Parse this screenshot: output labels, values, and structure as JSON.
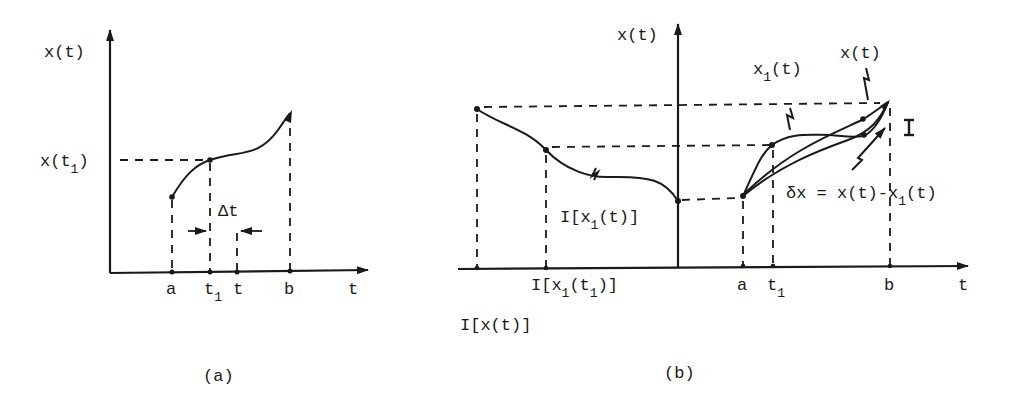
{
  "figure_a": {
    "caption": "(a)",
    "y_axis_label": "x(t)",
    "x_axis_label": "t",
    "y_marker_label": "x(t",
    "y_marker_sub": "1",
    "y_marker_close": ")",
    "delta_label": "Δt",
    "ticks": [
      {
        "label": "a"
      },
      {
        "label": "t",
        "sub": "1"
      },
      {
        "label": "t"
      },
      {
        "label": "b"
      }
    ]
  },
  "figure_b": {
    "caption": "(b)",
    "y_axis_label": "x(t)",
    "x_axis_label": "t",
    "curve_label_x1": {
      "pre": "x",
      "sub": "1",
      "post": "(t)"
    },
    "curve_label_x": "x(t)",
    "image_label": {
      "pre": "I[x",
      "sub": "1",
      "post": "(t)]"
    },
    "delta_label": {
      "pre": "δx = x(t)-x",
      "sub": "1",
      "post": "(t)"
    },
    "tick_image_t1": {
      "pre": "I[x",
      "sub1": "1",
      "mid": "(t",
      "sub2": "1",
      "post": ")]"
    },
    "tick_image_x": "I[x(t)]",
    "ticks": [
      {
        "label": "a"
      },
      {
        "label": "t",
        "sub": "1"
      },
      {
        "label": "b"
      }
    ]
  }
}
